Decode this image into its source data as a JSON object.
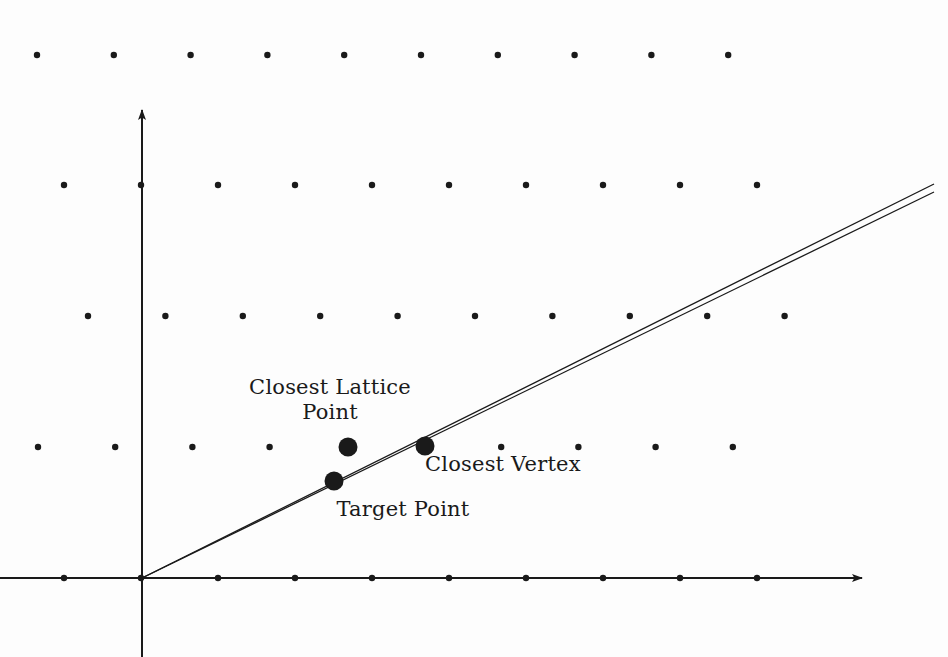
{
  "figure": {
    "name": "lattice-closest-vertex-diagram",
    "width": 948,
    "height": 657,
    "background_color": "#fdfdfd",
    "ink_color": "#1a1a1a"
  },
  "labels": {
    "closest_lattice_point": "Closest Lattice\nPoint",
    "closest_vertex": "Closest Vertex",
    "target_point": "Target Point"
  },
  "chart_data": {
    "type": "scatter",
    "title": "",
    "xlabel": "",
    "ylabel": "",
    "grid": false,
    "legend": "none",
    "axes": {
      "origin": [
        142,
        578
      ],
      "x_axis": {
        "from": [
          0,
          578
        ],
        "to": [
          862,
          578
        ],
        "arrow": "right"
      },
      "y_axis": {
        "from": [
          142,
          657
        ],
        "to": [
          142,
          110
        ],
        "arrow": "up"
      }
    },
    "lattice": {
      "description": "staggered point lattice, radius 3.2px dots",
      "dot_radius": 3.2,
      "rows": [
        {
          "y": 55,
          "x_start": 37,
          "spacing": 76.8,
          "count": 10
        },
        {
          "y": 185,
          "x_start": 64,
          "spacing": 77.0,
          "count": 10
        },
        {
          "y": 316,
          "x_start": 88,
          "spacing": 77.4,
          "count": 10
        },
        {
          "y": 447,
          "x_start": 38,
          "spacing": 77.2,
          "count": 10
        },
        {
          "y": 578,
          "x_start": 64,
          "spacing": 77.0,
          "count": 10
        }
      ]
    },
    "cone_lines": [
      {
        "name": "upper-ray",
        "from": [
          142,
          578
        ],
        "to": [
          934,
          184
        ]
      },
      {
        "name": "lower-ray",
        "from": [
          142,
          578
        ],
        "to": [
          934,
          192
        ]
      }
    ],
    "highlighted_points": [
      {
        "name": "closest-lattice-point",
        "x": 348,
        "y": 447,
        "radius": 9.5,
        "label": "Closest Lattice Point"
      },
      {
        "name": "closest-vertex",
        "x": 425,
        "y": 446,
        "radius": 9.5,
        "label": "Closest Vertex"
      },
      {
        "name": "target-point",
        "x": 334,
        "y": 481,
        "radius": 9.5,
        "label": "Target Point"
      }
    ]
  }
}
